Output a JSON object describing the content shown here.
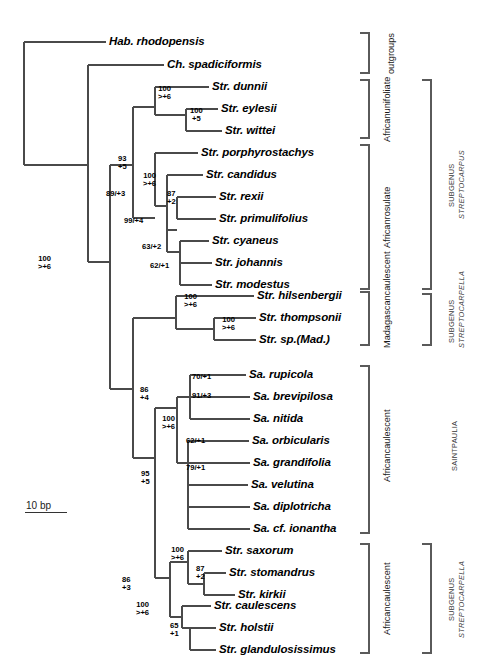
{
  "figure": {
    "type": "phylogenetic-cladogram",
    "scale_bar": {
      "label": "10 bp",
      "length_px": 42
    }
  },
  "taxa": [
    {
      "id": "hab_rhodopensis",
      "label": "Hab. rhodopensis",
      "y": 42,
      "tip_x": 106
    },
    {
      "id": "ch_spadiciformis",
      "label": "Ch. spadiciformis",
      "y": 65,
      "tip_x": 164
    },
    {
      "id": "str_dunnii",
      "label": "Str. dunnii",
      "y": 87,
      "tip_x": 209
    },
    {
      "id": "str_eylesii",
      "label": "Str. eylesii",
      "y": 109,
      "tip_x": 218
    },
    {
      "id": "str_wittei",
      "label": "Str. wittei",
      "y": 131,
      "tip_x": 222
    },
    {
      "id": "str_porphyrostachys",
      "label": "Str. porphyrostachys",
      "y": 153,
      "tip_x": 198
    },
    {
      "id": "str_candidus",
      "label": "Str. candidus",
      "y": 175,
      "tip_x": 203
    },
    {
      "id": "str_rexii",
      "label": "Str. rexii",
      "y": 197,
      "tip_x": 216
    },
    {
      "id": "str_primulifolius",
      "label": "Str. primulifolius",
      "y": 219,
      "tip_x": 216
    },
    {
      "id": "str_cyaneus",
      "label": "Str. cyaneus",
      "y": 241,
      "tip_x": 209
    },
    {
      "id": "str_johannis",
      "label": "Str. johannis",
      "y": 263,
      "tip_x": 212
    },
    {
      "id": "str_modestus",
      "label": "Str. modestus",
      "y": 285,
      "tip_x": 212
    },
    {
      "id": "str_hilsenbergii",
      "label": "Str. hilsenbergii",
      "y": 296,
      "tip_x": 254
    },
    {
      "id": "str_thompsonii",
      "label": "Str. thompsonii",
      "y": 318,
      "tip_x": 256
    },
    {
      "id": "str_sp_mad",
      "label": "Str. sp.(Mad.)",
      "y": 340,
      "tip_x": 256
    },
    {
      "id": "sa_rupicola",
      "label": "Sa. rupicola",
      "y": 375,
      "tip_x": 246
    },
    {
      "id": "sa_brevipilosa",
      "label": "Sa. brevipilosa",
      "y": 397,
      "tip_x": 250
    },
    {
      "id": "sa_nitida",
      "label": "Sa. nitida",
      "y": 419,
      "tip_x": 250
    },
    {
      "id": "sa_orbicularis",
      "label": "Sa. orbicularis",
      "y": 441,
      "tip_x": 249
    },
    {
      "id": "sa_grandifolia",
      "label": "Sa. grandifolia",
      "y": 463,
      "tip_x": 250
    },
    {
      "id": "sa_velutina",
      "label": "Sa. velutina",
      "y": 485,
      "tip_x": 248
    },
    {
      "id": "sa_diplotricha",
      "label": "Sa. diplotricha",
      "y": 507,
      "tip_x": 250
    },
    {
      "id": "sa_cf_ionantha",
      "label": "Sa. cf. ionantha",
      "y": 529,
      "tip_x": 250
    },
    {
      "id": "str_saxorum",
      "label": "Str. saxorum",
      "y": 551,
      "tip_x": 222
    },
    {
      "id": "str_stomandrus",
      "label": "Str. stomandrus",
      "y": 573,
      "tip_x": 226
    },
    {
      "id": "str_kirkii",
      "label": "Str. kirkii",
      "y": 595,
      "tip_x": 235
    },
    {
      "id": "str_caulescens",
      "label": "Str. caulescens",
      "y": 606,
      "tip_x": 211
    },
    {
      "id": "str_holstii",
      "label": "Str. holstii",
      "y": 628,
      "tip_x": 216
    },
    {
      "id": "str_glandulosissimus",
      "label": "Str. glandulosissimus",
      "y": 650,
      "tip_x": 216
    }
  ],
  "support_labels": [
    {
      "id": "sup-unifoliate-crown",
      "line1": "100",
      "line2": ">+6",
      "x": 158,
      "y": 85,
      "layout": "stack"
    },
    {
      "id": "sup-eylesii-wittei",
      "line1": "100",
      "line2": "+5",
      "x": 190,
      "y": 107,
      "layout": "stack"
    },
    {
      "id": "sup-node-93",
      "line1": "93",
      "line2": "+5",
      "x": 118,
      "y": 155,
      "layout": "stack"
    },
    {
      "id": "sup-rosulate-crown",
      "line1": "100",
      "line2": ">+6",
      "x": 143,
      "y": 172,
      "layout": "stack"
    },
    {
      "id": "sup-89-3",
      "line1": "89/+3",
      "line2": "",
      "x": 106,
      "y": 190,
      "layout": "inline"
    },
    {
      "id": "sup-87-2",
      "line1": "87",
      "line2": "+2",
      "x": 167,
      "y": 190,
      "layout": "stack"
    },
    {
      "id": "sup-99-4",
      "line1": "99/+4",
      "line2": "",
      "x": 124,
      "y": 217,
      "layout": "inline"
    },
    {
      "id": "sup-63-2",
      "line1": "63/+2",
      "line2": "",
      "x": 142,
      "y": 243,
      "layout": "inline"
    },
    {
      "id": "sup-62-1",
      "line1": "62/+1",
      "line2": "",
      "x": 150,
      "y": 262,
      "layout": "inline"
    },
    {
      "id": "sup-streptocarpus-root",
      "line1": "100",
      "line2": ">+6",
      "x": 38,
      "y": 255,
      "layout": "stack"
    },
    {
      "id": "sup-madagascan-crown",
      "line1": "100",
      "line2": ">+6",
      "x": 184,
      "y": 293,
      "layout": "stack"
    },
    {
      "id": "sup-thompsonii-sp",
      "line1": "100",
      "line2": ">+6",
      "x": 222,
      "y": 316,
      "layout": "stack"
    },
    {
      "id": "sup-node-86-4",
      "line1": "86",
      "line2": "+4",
      "x": 140,
      "y": 386,
      "layout": "stack"
    },
    {
      "id": "sup-70-1",
      "line1": "70/+1",
      "line2": "",
      "x": 192,
      "y": 373,
      "layout": "inline"
    },
    {
      "id": "sup-91-3",
      "line1": "91/+3",
      "line2": "",
      "x": 192,
      "y": 392,
      "layout": "inline"
    },
    {
      "id": "sup-saintpaulia-crown",
      "line1": "100",
      "line2": ">+6",
      "x": 162,
      "y": 415,
      "layout": "stack"
    },
    {
      "id": "sup-62-1b",
      "line1": "62/+1",
      "line2": "",
      "x": 186,
      "y": 437,
      "layout": "inline"
    },
    {
      "id": "sup-79-1",
      "line1": "79/+1",
      "line2": "",
      "x": 186,
      "y": 464,
      "layout": "inline"
    },
    {
      "id": "sup-node-95-5",
      "line1": "95",
      "line2": "+5",
      "x": 141,
      "y": 470,
      "layout": "stack"
    },
    {
      "id": "sup-saxorum-crown",
      "line1": "100",
      "line2": ">+6",
      "x": 171,
      "y": 546,
      "layout": "stack"
    },
    {
      "id": "sup-87-2b",
      "line1": "87",
      "line2": "+2",
      "x": 196,
      "y": 565,
      "layout": "stack"
    },
    {
      "id": "sup-node-86-3",
      "line1": "86",
      "line2": "+3",
      "x": 122,
      "y": 576,
      "layout": "stack"
    },
    {
      "id": "sup-caulescens-crown",
      "line1": "100",
      "line2": ">+6",
      "x": 136,
      "y": 601,
      "layout": "stack"
    },
    {
      "id": "sup-65-1",
      "line1": "65",
      "line2": "+1",
      "x": 170,
      "y": 622,
      "layout": "stack"
    }
  ],
  "group_labels": [
    {
      "id": "grp-outgroups",
      "line1": "outgroups",
      "line2": "",
      "x": 386,
      "y": 26,
      "h": 56
    },
    {
      "id": "grp-african-unifoliate",
      "line1": "African",
      "line2": "unifoliate",
      "x": 382,
      "y": 78,
      "h": 64
    },
    {
      "id": "grp-african-rosulate",
      "line1": "African",
      "line2": "rosulate",
      "x": 382,
      "y": 142,
      "h": 150
    },
    {
      "id": "grp-madagascan-caulescent",
      "line1": "Madagascan",
      "line2": "caulescent",
      "x": 382,
      "y": 286,
      "h": 62
    },
    {
      "id": "grp-african-caulescent-1",
      "line1": "African",
      "line2": "caulescent",
      "x": 382,
      "y": 352,
      "h": 188
    },
    {
      "id": "grp-african-caulescent-2",
      "line1": "African",
      "line2": "caulescent",
      "x": 382,
      "y": 542,
      "h": 114
    }
  ],
  "taxon_labels": [
    {
      "id": "tax-subgenus-streptocarpus",
      "line1": "SUBGENUS",
      "line2": "STREPTOCARPUS",
      "x": 447,
      "y": 78,
      "h": 214
    },
    {
      "id": "tax-subgenus-streptocarpella",
      "line1": "SUBGENUS",
      "line2": "STREPTOCARPELLA",
      "x": 447,
      "y": 294,
      "h": 54
    },
    {
      "id": "tax-saintpaulia",
      "line1": "SAINTPAULIA",
      "line2": "",
      "x": 450,
      "y": 360,
      "h": 172
    },
    {
      "id": "tax-subgenus-streptocarpella-2",
      "line1": "SUBGENUS",
      "line2": "STREPTOCARPELLA",
      "x": 447,
      "y": 542,
      "h": 114
    }
  ],
  "brackets": [
    {
      "id": "bracket-outgroups",
      "x": 369,
      "y1": 33,
      "y2": 73,
      "tick": 9
    },
    {
      "id": "bracket-african-unifoliate",
      "x": 369,
      "y1": 80,
      "y2": 138,
      "tick": 9
    },
    {
      "id": "bracket-african-rosulate",
      "x": 369,
      "y1": 145,
      "y2": 289,
      "tick": 9
    },
    {
      "id": "bracket-madagascan-caulescent",
      "x": 369,
      "y1": 292,
      "y2": 345,
      "tick": 9
    },
    {
      "id": "bracket-african-caulescent-1",
      "x": 369,
      "y1": 366,
      "y2": 533,
      "tick": 9
    },
    {
      "id": "bracket-african-caulescent-2",
      "x": 369,
      "y1": 544,
      "y2": 653,
      "tick": 9
    },
    {
      "id": "bracket-subgenus-streptocarpus",
      "x": 431,
      "y1": 80,
      "y2": 289,
      "tick": 9
    },
    {
      "id": "bracket-subgenus-streptocarpella-1",
      "x": 431,
      "y1": 294,
      "y2": 345,
      "tick": 9
    },
    {
      "id": "bracket-subgenus-streptocarpella-2",
      "x": 431,
      "y1": 544,
      "y2": 653,
      "tick": 9
    }
  ]
}
